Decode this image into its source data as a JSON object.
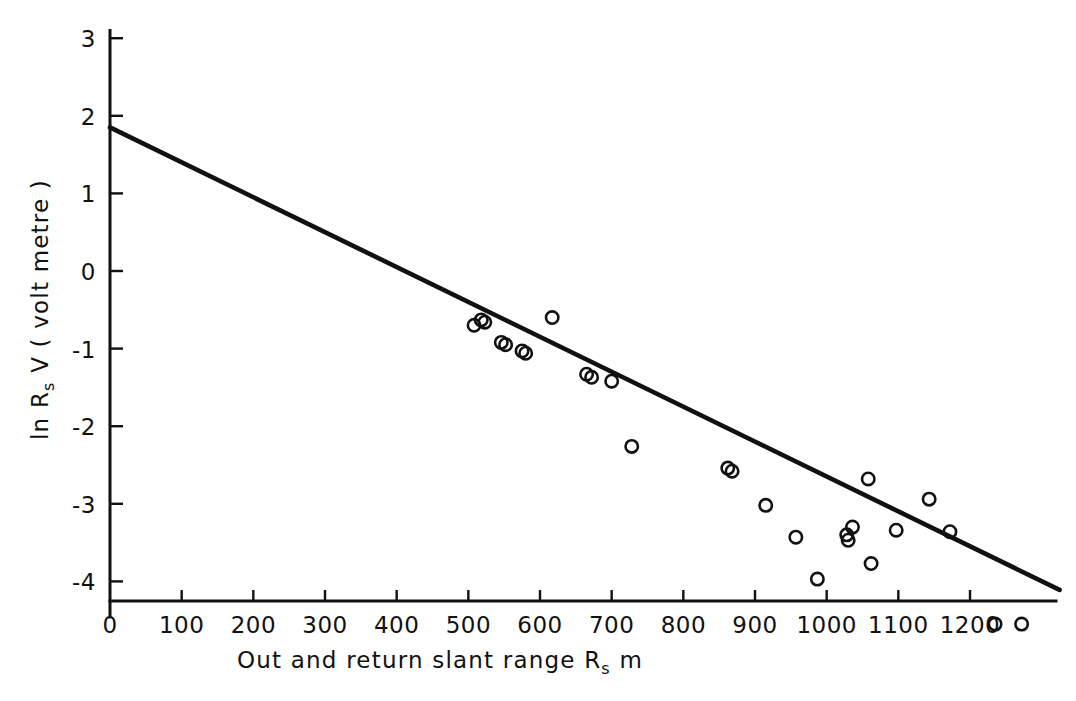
{
  "chart_data": {
    "type": "scatter",
    "title": "",
    "xlabel": "Out and return slant range  R_s   m",
    "xlabel_parts": {
      "before": "Out and return slant range",
      "symbol": "R",
      "subscript": "s",
      "unit": "m"
    },
    "ylabel": "ln R_s V  ( volt metre )",
    "ylabel_parts": {
      "prefix": "ln",
      "symbol": "R",
      "subscript": "s",
      "variable": "V",
      "unit": "( volt metre )"
    },
    "xlim": [
      0,
      1320
    ],
    "ylim": [
      -4.75,
      3.1
    ],
    "xticks": [
      0,
      100,
      200,
      300,
      400,
      500,
      600,
      700,
      800,
      900,
      1000,
      1100,
      1200
    ],
    "xticklabels": [
      "0",
      "100",
      "200",
      "300",
      "400",
      "500",
      "600",
      "700",
      "800",
      "900",
      "1000",
      "1100",
      "1200"
    ],
    "yticks": [
      3,
      2,
      1,
      0,
      -1,
      -2,
      -3,
      -4
    ],
    "yticklabels": [
      "3",
      "2",
      "1",
      "0",
      "-1",
      "-2",
      "-3",
      "-4"
    ],
    "grid": false,
    "legend": false,
    "marker": "open-circle",
    "series": [
      {
        "name": "measurements",
        "marker": "open-circle",
        "points": [
          [
            508,
            -0.7
          ],
          [
            518,
            -0.63
          ],
          [
            523,
            -0.66
          ],
          [
            546,
            -0.92
          ],
          [
            552,
            -0.95
          ],
          [
            575,
            -1.03
          ],
          [
            580,
            -1.06
          ],
          [
            617,
            -0.6
          ],
          [
            665,
            -1.33
          ],
          [
            672,
            -1.37
          ],
          [
            700,
            -1.42
          ],
          [
            728,
            -2.26
          ],
          [
            862,
            -2.54
          ],
          [
            868,
            -2.58
          ],
          [
            915,
            -3.02
          ],
          [
            957,
            -3.43
          ],
          [
            987,
            -3.97
          ],
          [
            1028,
            -3.4
          ],
          [
            1030,
            -3.47
          ],
          [
            1036,
            -3.3
          ],
          [
            1058,
            -2.68
          ],
          [
            1062,
            -3.77
          ],
          [
            1097,
            -3.34
          ],
          [
            1143,
            -2.94
          ],
          [
            1172,
            -3.36
          ],
          [
            1235,
            -4.55
          ],
          [
            1272,
            -4.55
          ]
        ]
      }
    ],
    "fit_line": {
      "name": "least-squares fit",
      "x_start": 0,
      "y_start": 1.85,
      "x_end": 1325,
      "y_end": -4.11,
      "slope_per_metre": -0.0045,
      "intercept": 1.85
    }
  }
}
